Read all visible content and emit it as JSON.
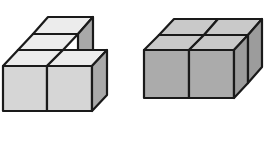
{
  "figures": [
    {
      "name": "stepped-cube-arrangement",
      "description": "Five unit cubes: two in the front row, with two cubes stacked behind on the left column in a rising staircase",
      "cube_count": 5,
      "colors": {
        "top": "#ececec",
        "front": "#d6d6d6",
        "side": "#a9a9a9",
        "edge": "#1a1a1a"
      }
    },
    {
      "name": "two-by-two-cube-block",
      "description": "Four unit cubes arranged in a 2x2 flat block",
      "cube_count": 4,
      "colors": {
        "top": "#c9c9c9",
        "front": "#ababab",
        "side": "#9c9c9c",
        "edge": "#1a1a1a"
      }
    }
  ]
}
